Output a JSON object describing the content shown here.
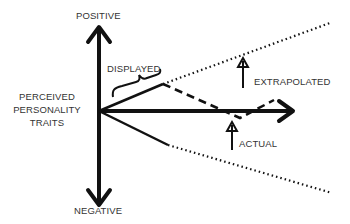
{
  "diagram": {
    "labels": {
      "positive": "POSITIVE",
      "negative": "NEGATIVE",
      "axis_line1": "PERCEIVED",
      "axis_line2": "PERSONALITY",
      "axis_line3": "TRAITS",
      "displayed": "DISPLAYED",
      "extrapolated": "EXTRAPOLATED",
      "actual": "ACTUAL"
    },
    "colors": {
      "ink": "#111111",
      "text": "#333333",
      "background": "#ffffff"
    }
  }
}
